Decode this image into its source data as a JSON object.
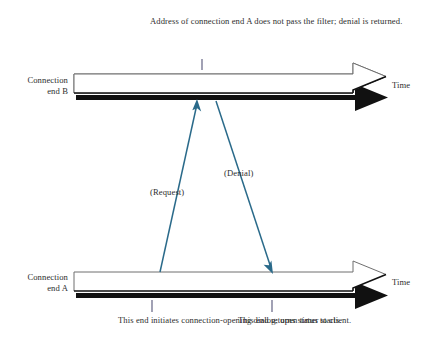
{
  "diagram": {
    "colors": {
      "line": "#2a6a8a",
      "bar_fill": "#ffffff",
      "bar_outline": "#6f6f6f",
      "bar_shadow": "#111111",
      "text": "#2e2e2e",
      "tick": "#555577"
    },
    "lifelines": [
      {
        "id": "end-b",
        "label": "Connection\nend B",
        "axis_label": "Time"
      },
      {
        "id": "end-a",
        "label": "Connection\nend A",
        "axis_label": "Time"
      }
    ],
    "messages": [
      {
        "id": "request",
        "label": "(Request)",
        "from": "end-a",
        "to": "end-b"
      },
      {
        "id": "denial",
        "label": "(Denial)",
        "from": "end-b",
        "to": "end-a"
      }
    ],
    "annotations": [
      {
        "id": "filter-note",
        "text": "Address of connection end A does not pass the filter; denial is returned.",
        "attached_to": "end-b"
      },
      {
        "id": "initiate-note",
        "text": "This end initiates connection-opening dialog; open timer starts.",
        "attached_to": "end-a"
      },
      {
        "id": "status-note",
        "text": "This end returns status to client.",
        "attached_to": "end-a"
      }
    ]
  }
}
